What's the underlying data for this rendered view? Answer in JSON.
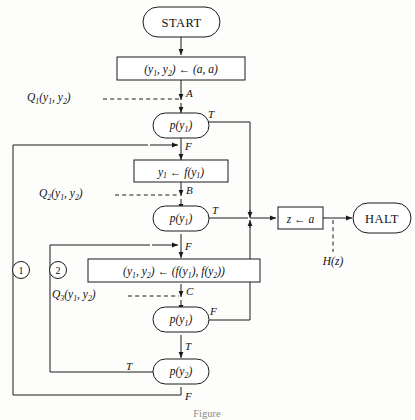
{
  "figure": {
    "caption": "Figure"
  },
  "nodes": {
    "start": {
      "id": "start",
      "label": "START",
      "shape": "stadium"
    },
    "halt": {
      "id": "halt",
      "label": "HALT",
      "shape": "stadium"
    },
    "assign_init": {
      "id": "assign-init",
      "shape": "box",
      "lhs": "(y",
      "lhs_sub1": "1",
      "lhs_mid": ", y",
      "lhs_sub2": "2",
      "lhs_end": ")",
      "arrow": "←",
      "rhs": "(a, a)"
    },
    "assign_f1": {
      "id": "assign-f1",
      "shape": "box",
      "text_main": "y",
      "text_sub": "1",
      "arrow": "←",
      "text_rhs": "f(y",
      "text_rhs_sub": "1",
      "text_rhs_end": ")"
    },
    "assign_pair": {
      "id": "assign-pair",
      "shape": "box",
      "text": "(y1, y2) ← (f(y1), f(y2))"
    },
    "assign_z": {
      "id": "assign-z",
      "shape": "box",
      "lhs": "z",
      "arrow": "←",
      "rhs": "a"
    },
    "test_a": {
      "id": "test-a",
      "shape": "stadium",
      "pred": "p",
      "arg": "y",
      "arg_sub": "1"
    },
    "test_b": {
      "id": "test-b",
      "shape": "stadium",
      "pred": "p",
      "arg": "y",
      "arg_sub": "1"
    },
    "test_c": {
      "id": "test-c",
      "shape": "stadium",
      "pred": "p",
      "arg": "y",
      "arg_sub": "1"
    },
    "test_d": {
      "id": "test-d",
      "shape": "stadium",
      "pred": "p",
      "arg": "y",
      "arg_sub": "2"
    }
  },
  "cut_points": [
    {
      "name": "A",
      "label": "A",
      "assertion_fn": "Q",
      "assertion_sub": "1",
      "assertion_args": "(y1, y2)"
    },
    {
      "name": "B",
      "label": "B",
      "assertion_fn": "Q",
      "assertion_sub": "2",
      "assertion_args": "(y1, y2)"
    },
    {
      "name": "C",
      "label": "C",
      "assertion_fn": "Q",
      "assertion_sub": "3",
      "assertion_args": "(y1, y2)"
    }
  ],
  "output_assertion": {
    "fn": "H",
    "arg": "(z)",
    "full": "H(z)"
  },
  "branch_labels": {
    "test_a_true": "T",
    "test_a_false": "F",
    "test_b_true": "T",
    "test_b_false": "F",
    "test_c_true": "T",
    "test_c_false": "F",
    "test_d_true": "T",
    "test_d_false": "F"
  },
  "loops": [
    {
      "id": "loop-1",
      "number": "1"
    },
    {
      "id": "loop-2",
      "number": "2"
    }
  ],
  "colors": {
    "stroke": "#1a1a1a",
    "fill": "#ffffff",
    "background": "#fdfdfc",
    "caption": "#8a8a8a"
  }
}
